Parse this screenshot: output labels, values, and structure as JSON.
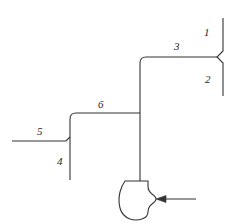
{
  "diagram": {
    "type": "process-flow-diagram",
    "stroke_color": "#333333",
    "label_color": "#242424",
    "background_color": "#ffffff",
    "labels": [
      {
        "id": "1",
        "text": "1",
        "x": 204,
        "y": 27,
        "refers_to": "upper-right-vertical-line"
      },
      {
        "id": "2",
        "text": "2",
        "x": 205,
        "y": 74,
        "refers_to": "lower-right-vertical-line"
      },
      {
        "id": "3",
        "text": "3",
        "x": 174,
        "y": 41,
        "refers_to": "upper-horizontal-line"
      },
      {
        "id": "4",
        "text": "4",
        "x": 57,
        "y": 156,
        "refers_to": "lower-left-vertical-line"
      },
      {
        "id": "5",
        "text": "5",
        "x": 37,
        "y": 126,
        "refers_to": "left-horizontal-line"
      },
      {
        "id": "6",
        "text": "6",
        "x": 98,
        "y": 99,
        "refers_to": "middle-horizontal-line"
      }
    ],
    "components": [
      {
        "name": "pump",
        "shape": "rounded-blob-with-notch",
        "cx": 140,
        "cy": 198
      },
      {
        "name": "inlet-arrow",
        "direction": "left",
        "from_x": 196,
        "to_x": 155,
        "y": 199
      }
    ]
  }
}
